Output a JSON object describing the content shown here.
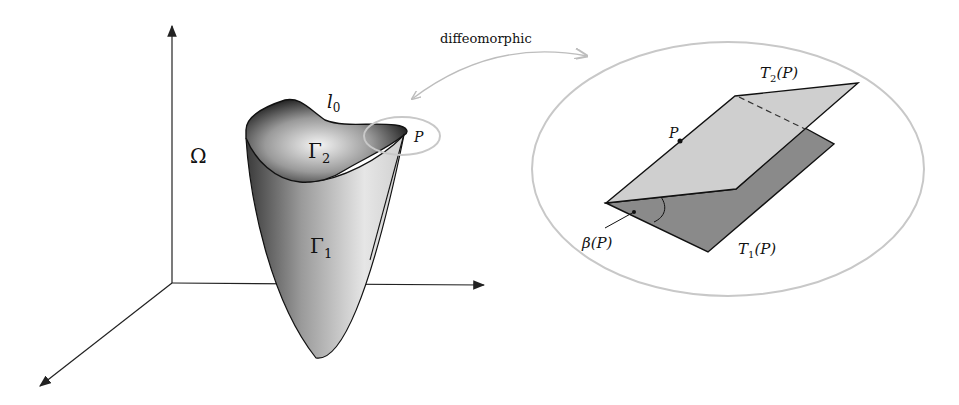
{
  "figure": {
    "left_panel": {
      "domain_label": "Ω",
      "surface_upper_label": "Γ",
      "surface_upper_sub": "2",
      "surface_lower_label": "Γ",
      "surface_lower_sub": "1",
      "curve_label": "l",
      "curve_sub": "0",
      "point_label": "P"
    },
    "connector": {
      "label": "diffeomorphic"
    },
    "right_panel": {
      "point_label": "P",
      "plane_upper_label": "T",
      "plane_upper_sub": "2",
      "plane_upper_arg": "(P)",
      "plane_lower_label": "T",
      "plane_lower_sub": "1",
      "plane_lower_arg": "(P)",
      "angle_label": "β(P)"
    },
    "colors": {
      "axis": "#222222",
      "ellipse": "#c8c8c8",
      "arrow": "#bdbdbd",
      "plane_upper": "#cfcfcf",
      "plane_lower": "#8a8a8a"
    }
  }
}
